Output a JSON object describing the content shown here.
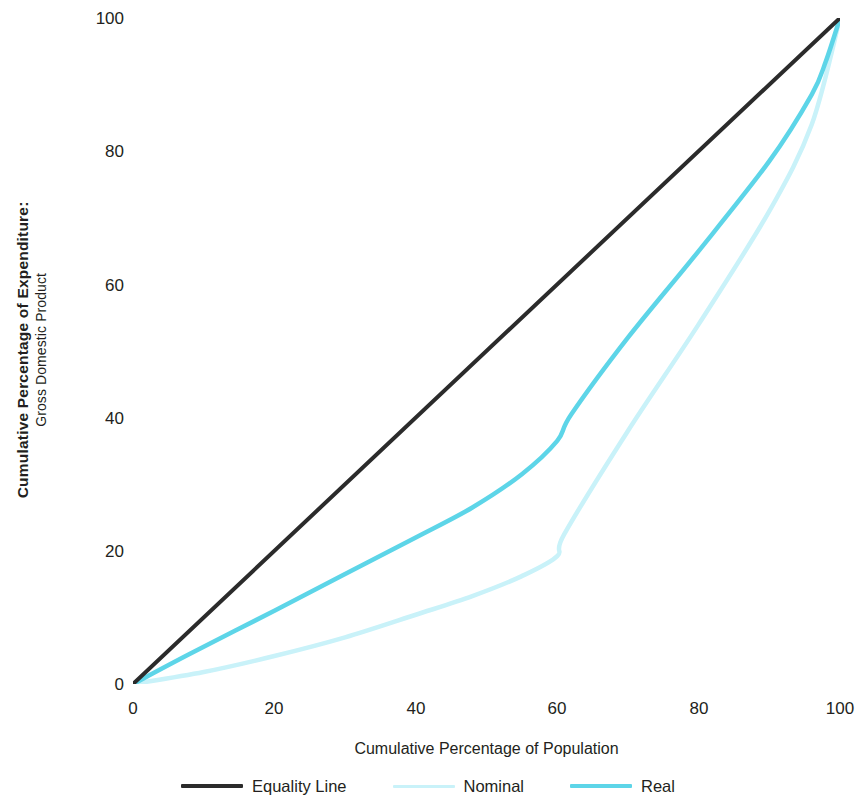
{
  "axes": {
    "y_title_main": "Cumulative Percentage of Expenditure:",
    "y_title_sub": "Gross Domestic Product",
    "x_title": "Cumulative Percentage of Population",
    "y_ticks": [
      "0",
      "20",
      "40",
      "60",
      "80",
      "100"
    ],
    "x_ticks": [
      "0",
      "20",
      "40",
      "60",
      "80",
      "100"
    ]
  },
  "legend": {
    "items": [
      {
        "label": "Equality Line",
        "color": "#2b2b2b"
      },
      {
        "label": "Nominal",
        "color": "#c9f2f9"
      },
      {
        "label": "Real",
        "color": "#5dd5e8"
      }
    ]
  },
  "colors": {
    "equality": "#2b2b2b",
    "nominal": "#c9f2f9",
    "real": "#5dd5e8",
    "background": "#ffffff",
    "text": "#231f20"
  },
  "chart_data": {
    "type": "line",
    "title": "",
    "subtitle": "",
    "xlabel": "Cumulative Percentage of Population",
    "ylabel": "Cumulative Percentage of Expenditure: Gross Domestic Product",
    "xlim": [
      0,
      100
    ],
    "ylim": [
      0,
      100
    ],
    "xticks": [
      0,
      20,
      40,
      60,
      80,
      100
    ],
    "yticks": [
      0,
      20,
      40,
      60,
      80,
      100
    ],
    "grid": false,
    "legend_position": "bottom",
    "series": [
      {
        "name": "Equality Line",
        "color": "#2b2b2b",
        "x": [
          0,
          100
        ],
        "y": [
          0,
          100
        ]
      },
      {
        "name": "Nominal",
        "color": "#c9f2f9",
        "x": [
          0,
          10,
          20,
          30,
          40,
          48,
          55,
          60,
          61,
          70,
          80,
          90,
          96,
          100
        ],
        "y": [
          0,
          1.8,
          4.2,
          7.0,
          10.4,
          13.2,
          16.2,
          19.2,
          22.5,
          38.0,
          54.0,
          71.0,
          84.0,
          100
        ]
      },
      {
        "name": "Real",
        "color": "#5dd5e8",
        "x": [
          0,
          8,
          20,
          30,
          40,
          48,
          55,
          60,
          62,
          70,
          80,
          90,
          96,
          98,
          100
        ],
        "y": [
          0,
          4.5,
          11.0,
          16.5,
          22.0,
          26.5,
          31.5,
          36.5,
          40.5,
          52.0,
          65.0,
          78.5,
          88.5,
          93.5,
          100
        ]
      }
    ]
  }
}
